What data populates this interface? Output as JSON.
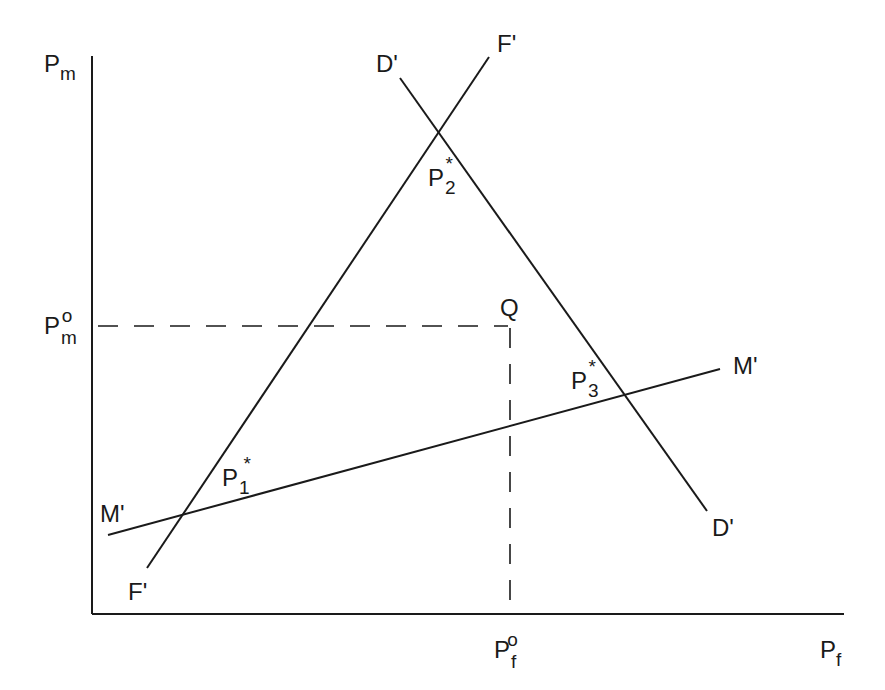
{
  "axes": {
    "y_label": "P",
    "y_sub": "m",
    "x_label": "P",
    "x_sub": "f"
  },
  "reference": {
    "pm0_label": "P",
    "pm0_sub": "m",
    "pm0_sup": "o",
    "pf0_label": "P",
    "pf0_sub": "f",
    "pf0_sup": "o",
    "point_q": "Q"
  },
  "curves": {
    "f_top": "F'",
    "f_bottom": "F'",
    "d_top": "D'",
    "d_bottom": "D'",
    "m_left": "M'",
    "m_right": "M'"
  },
  "equilibria": {
    "p1": "P",
    "p1_sub": "1",
    "p1_sup": "*",
    "p2": "P",
    "p2_sub": "2",
    "p2_sup": "*",
    "p3": "P",
    "p3_sub": "3",
    "p3_sup": "*"
  }
}
